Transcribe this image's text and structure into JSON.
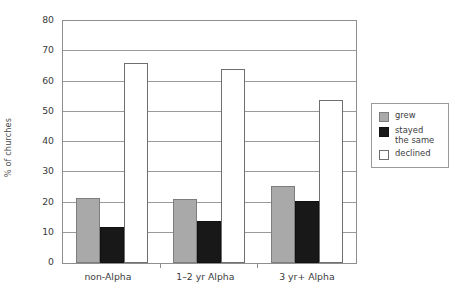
{
  "chart_data": {
    "type": "bar",
    "title": "",
    "xlabel": "",
    "ylabel": "% of churches",
    "ylim": [
      0,
      80
    ],
    "ytick_step": 10,
    "yticks": [
      80,
      70,
      60,
      50,
      40,
      30,
      20,
      10,
      0
    ],
    "grid": true,
    "legend_position": "right",
    "categories": [
      "non-Alpha",
      "1–2 yr Alpha",
      "3 yr+ Alpha"
    ],
    "series": [
      {
        "name": "grew",
        "color": "#a9a9a9",
        "values": [
          21.5,
          21,
          25.5
        ]
      },
      {
        "name": "stayed\nthe same",
        "color": "#181818",
        "values": [
          12,
          14,
          20.5
        ]
      },
      {
        "name": "declined",
        "color": "#ffffff",
        "values": [
          66,
          64,
          54
        ]
      }
    ]
  },
  "legend": {
    "items": [
      {
        "label": "grew"
      },
      {
        "label": "stayed\nthe same"
      },
      {
        "label": "declined"
      }
    ]
  }
}
